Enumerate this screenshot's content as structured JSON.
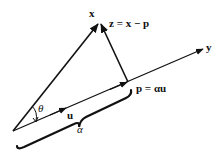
{
  "diagram": {
    "type": "vector-projection",
    "labels": {
      "x": "x",
      "y": "y",
      "z": "z = x − p",
      "p": "p = αu",
      "u": "u",
      "theta": "θ",
      "alpha": "α"
    },
    "colors": {
      "stroke": "#111111",
      "background": "#ffffff"
    }
  }
}
